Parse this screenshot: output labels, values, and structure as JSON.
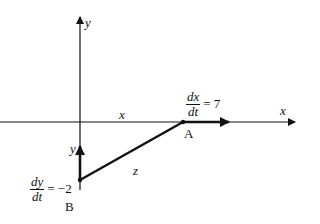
{
  "diagram": {
    "axes": {
      "x_label": "x",
      "y_label": "y"
    },
    "segments": {
      "horizontal_label": "x",
      "vertical_label": "y",
      "hypotenuse_label": "z"
    },
    "points": {
      "A": "A",
      "B": "B"
    },
    "rates": {
      "dx": {
        "num": "dx",
        "den": "dt",
        "eq": "= 7"
      },
      "dy": {
        "num": "dy",
        "den": "dt",
        "eq": "= −2"
      }
    },
    "colors": {
      "stroke": "#111111",
      "background": "#ffffff"
    }
  }
}
